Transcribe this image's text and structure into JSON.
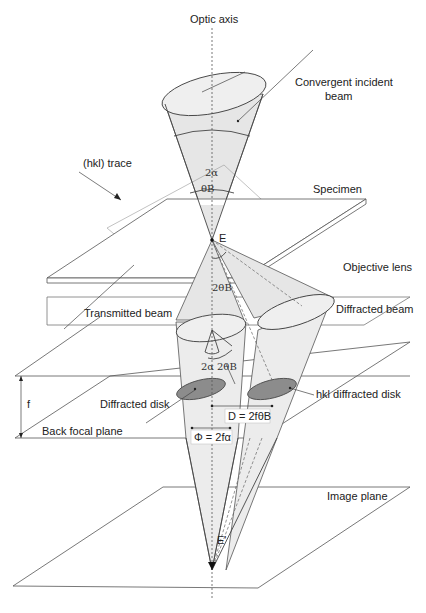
{
  "diagram": {
    "labels": {
      "optic_axis": "Optic axis",
      "convergent_incident_beam_line1": "Convergent incident",
      "convergent_incident_beam_line2": "beam",
      "hkl_trace": "(hkl) trace",
      "specimen": "Specimen",
      "point_E": "E",
      "objective_lens": "Objective lens",
      "transmitted_beam": "Transmitted beam",
      "diffracted_beam": "Diffracted beam",
      "diffracted_disk": "Diffracted disk",
      "hkl_diffracted_disk": "hkl diffracted disk",
      "focal_length": "f",
      "back_focal_plane": "Back focal plane",
      "image_plane": "Image plane",
      "point_E_prime": "E'"
    },
    "angles": {
      "two_alpha_top": "2α",
      "theta_B_top": "θB",
      "two_theta_B_mid": "2θB",
      "two_alpha_bottom": "2α",
      "two_theta_B_bottom": "2θB"
    },
    "equations": {
      "D": "D = 2fθB",
      "Phi": "Φ = 2fα"
    },
    "colors": {
      "beam_fill": "#e6e6e6",
      "disk_fill": "#8c8c8c",
      "line": "#444444"
    }
  }
}
